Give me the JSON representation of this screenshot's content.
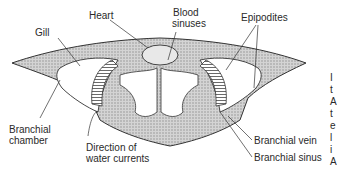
{
  "figure": {
    "labels": {
      "heart": "Heart",
      "blood_sinuses_line1": "Blood",
      "blood_sinuses_line2": "sinuses",
      "epipodites": "Epipodites",
      "gill": "Gill",
      "branchial_chamber_line1": "Branchial",
      "branchial_chamber_line2": "chamber",
      "direction_line1": "Direction of",
      "direction_line2": "water currents",
      "branchial_vein": "Branchial vein",
      "branchial_sinus": "Branchial sinus"
    },
    "cropped_edge_text": [
      "I",
      "t",
      "A",
      "t",
      "e",
      "l",
      "i",
      "A"
    ],
    "colors": {
      "ink": "#2a2a2a",
      "stipple": "#bdbdbd",
      "background": "#ffffff"
    }
  }
}
